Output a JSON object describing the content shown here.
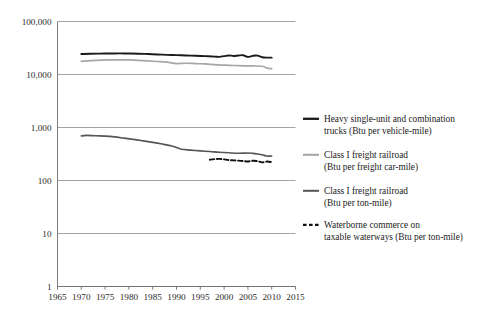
{
  "chart_data": {
    "type": "line",
    "title": "",
    "subtitle": "",
    "xlabel": "",
    "ylabel": "",
    "yscale": "log",
    "ylim": [
      1,
      100000
    ],
    "xlim": [
      1965,
      2015
    ],
    "grid": true,
    "legend_position": "right",
    "y_ticks": [
      1,
      10,
      100,
      1000,
      10000,
      100000
    ],
    "y_tick_labels": [
      "1",
      "10",
      "100",
      "1,000",
      "10,000",
      "100,000"
    ],
    "x_ticks": [
      1965,
      1970,
      1975,
      1980,
      1985,
      1990,
      1995,
      2000,
      2005,
      2010,
      2015
    ],
    "x_tick_labels": [
      "1965",
      "1970",
      "1975",
      "1980",
      "1985",
      "1990",
      "1995",
      "2000",
      "2005",
      "2010",
      "2015"
    ],
    "series": [
      {
        "name": "Heavy single-unit and combination trucks (Btu per vehicle-mile)",
        "color": "#1a1a1a",
        "width": 1.9,
        "dash": "none",
        "x": [
          1970,
          1972,
          1974,
          1976,
          1978,
          1980,
          1982,
          1984,
          1986,
          1988,
          1990,
          1992,
          1994,
          1996,
          1998,
          1999,
          2000,
          2001,
          2002,
          2003,
          2004,
          2005,
          2006,
          2007,
          2008,
          2009,
          2010
        ],
        "values": [
          24400,
          24700,
          24800,
          24900,
          25000,
          24900,
          24700,
          24300,
          23900,
          23500,
          23200,
          22900,
          22600,
          22200,
          21700,
          21500,
          22200,
          22900,
          22400,
          22800,
          23100,
          21500,
          22500,
          22700,
          21200,
          20800,
          20800
        ]
      },
      {
        "name": "Class I freight railroad (Btu per freight car-mile)",
        "color": "#a6a6a6",
        "width": 1.7,
        "dash": "none",
        "x": [
          1970,
          1972,
          1974,
          1976,
          1978,
          1980,
          1982,
          1984,
          1986,
          1988,
          1990,
          1992,
          1994,
          1996,
          1998,
          2000,
          2002,
          2004,
          2006,
          2008,
          2009,
          2010
        ],
        "values": [
          17700,
          18200,
          18600,
          18800,
          18900,
          18900,
          18400,
          18000,
          17600,
          17100,
          16100,
          16300,
          16100,
          15800,
          15400,
          15000,
          14800,
          14600,
          14500,
          14300,
          13200,
          12900
        ]
      },
      {
        "name": "Class I freight railroad (Btu per ton-mile)",
        "color": "#555555",
        "width": 1.6,
        "dash": "none",
        "x": [
          1970,
          1971,
          1973,
          1975,
          1977,
          1979,
          1981,
          1983,
          1985,
          1987,
          1989,
          1990,
          1991,
          1993,
          1995,
          1997,
          1999,
          2001,
          2003,
          2005,
          2006,
          2007,
          2008,
          2009,
          2010
        ],
        "values": [
          691,
          710,
          697,
          687,
          665,
          630,
          597,
          560,
          524,
          487,
          449,
          420,
          390,
          375,
          362,
          352,
          341,
          333,
          327,
          330,
          325,
          316,
          305,
          289,
          289
        ]
      },
      {
        "name": "Waterborne commerce on taxable waterways (Btu per ton-mile)",
        "color": "#111111",
        "width": 1.9,
        "dash": "4.5,2.6",
        "x": [
          1997,
          1998,
          1999,
          2000,
          2001,
          2002,
          2003,
          2004,
          2005,
          2006,
          2007,
          2008,
          2009,
          2010
        ],
        "values": [
          247,
          253,
          256,
          250,
          243,
          240,
          237,
          233,
          228,
          236,
          232,
          220,
          228,
          222
        ]
      }
    ]
  },
  "legend": {
    "items": [
      {
        "marker": "solid-thick-black",
        "line1": "Heavy single-unit and combination",
        "line2": "trucks (Btu per vehicle-mile)"
      },
      {
        "marker": "solid-light-gray",
        "line1": "Class I freight railroad",
        "line2": "(Btu per freight car-mile)"
      },
      {
        "marker": "solid-medium-gray",
        "line1": "Class I freight railroad",
        "line2": "(Btu per ton-mile)"
      },
      {
        "marker": "dashed-black",
        "line1": "Waterborne commerce on",
        "line2": "taxable waterways (Btu per ton-mile)"
      }
    ]
  },
  "colors": {
    "trucks": "#1a1a1a",
    "rail_car_mile": "#a6a6a6",
    "rail_ton_mile": "#555555",
    "waterborne": "#111111",
    "gridline": "#9a9a9a",
    "axis": "#6e6e6e",
    "text": "#1a1a1a",
    "background": "#ffffff"
  }
}
